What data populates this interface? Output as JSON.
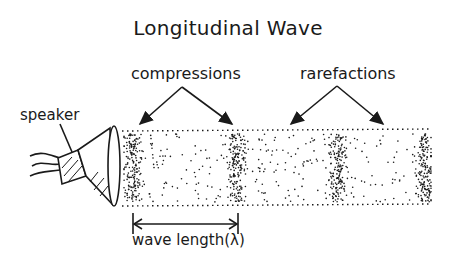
{
  "diagram": {
    "title": "Longitudinal Wave",
    "labels": {
      "compressions": "compressions",
      "rarefactions": "rarefactions",
      "speaker": "speaker",
      "wavelength": "wave length(λ)"
    },
    "components": [
      "speaker",
      "tube of air particles",
      "compression bands",
      "rarefaction regions",
      "wavelength arrow"
    ],
    "compression_x": [
      133,
      237,
      338,
      425
    ],
    "rarefaction_x": [
      288,
      385
    ],
    "tube": {
      "x1": 122,
      "x2": 432,
      "y1": 131,
      "y2": 205
    },
    "wavelength_arrow": {
      "x1": 133,
      "x2": 238,
      "y": 224
    },
    "ink_color": "#1a1a1a",
    "background": "#ffffff"
  }
}
